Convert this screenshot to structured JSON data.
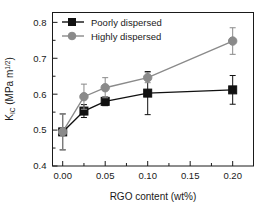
{
  "chart_data": {
    "type": "line",
    "title": "",
    "subtitle": "",
    "xlabel": "RGO content (wt%)",
    "ylabel": "K_IC (MPa m^1/2)",
    "ylabel_parts": {
      "base": "K",
      "subscript": "IC",
      "unit_pre": " (MPa m",
      "unit_sup": "1/2",
      "unit_post": ")"
    },
    "x": [
      0.0,
      0.025,
      0.05,
      0.1,
      0.2
    ],
    "xlim": [
      -0.012,
      0.2245
    ],
    "ylim": [
      0.4,
      0.8275
    ],
    "xticks": [
      0.0,
      0.05,
      0.1,
      0.15,
      0.2
    ],
    "xtick_labels": [
      "0.00",
      "0.05",
      "0.10",
      "0.15",
      "0.20"
    ],
    "yticks": [
      0.4,
      0.5,
      0.6,
      0.7,
      0.8
    ],
    "ytick_labels": [
      "0.4",
      "0.5",
      "0.6",
      "0.7",
      "0.8"
    ],
    "x_minor_ticks": [
      0.025,
      0.075,
      0.125,
      0.175
    ],
    "y_minor_ticks": [
      0.45,
      0.55,
      0.65,
      0.75
    ],
    "grid": false,
    "legend_position": "top-left",
    "series": [
      {
        "name": "Poorly dispersed",
        "marker": "square",
        "color": "#111111",
        "values": [
          0.495,
          0.553,
          0.58,
          0.603,
          0.612
        ],
        "errors": [
          0.05,
          0.018,
          0.012,
          0.06,
          0.04
        ]
      },
      {
        "name": "Highly dispersed",
        "marker": "circle",
        "color": "#8a8a8a",
        "values": [
          0.495,
          0.593,
          0.618,
          0.646,
          0.748
        ],
        "errors": [
          0.05,
          0.035,
          0.028,
          0.014,
          0.037
        ]
      }
    ]
  },
  "legend": {
    "entries": [
      {
        "label": "Poorly dispersed"
      },
      {
        "label": "Highly dispersed"
      }
    ]
  },
  "colors": {
    "series_poorly": "#111111",
    "series_highly": "#8a8a8a",
    "axis": "#1a1a1a",
    "background": "#ffffff"
  }
}
